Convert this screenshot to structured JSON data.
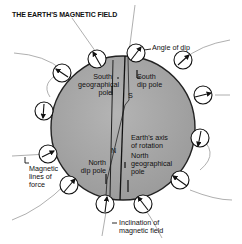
{
  "title": "THE EARTH'S MAGNETIC FIELD",
  "labels": {
    "angle_of_dip": "Angle of dip",
    "south_geo_1": "South",
    "south_geo_2": "geographical",
    "south_geo_3": "pole",
    "south_dip_1": "South",
    "south_dip_2": "dip pole",
    "s_marker": "S",
    "n_marker": "N",
    "axis_1": "Earth's axis",
    "axis_2": "of rotation",
    "north_geo_1": "North",
    "north_geo_2": "geographical",
    "north_geo_3": "pole",
    "north_dip_1": "North",
    "north_dip_2": "dip pole",
    "mag_lines_1": "Magnetic",
    "mag_lines_2": "lines of",
    "mag_lines_3": "force",
    "inclination_1": "Inclination of",
    "inclination_2": "magnetic field"
  },
  "colors": {
    "globe_fill": "#a8a8a8",
    "globe_stroke": "#222222",
    "field_line": "#9a9a9a",
    "ink": "#111111"
  }
}
